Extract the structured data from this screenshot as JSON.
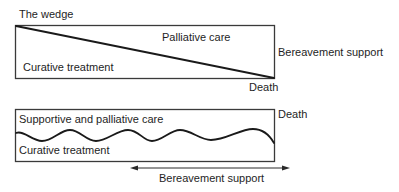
{
  "wedge_panel": {
    "title": "The wedge",
    "upper_region_label": "Palliative care",
    "lower_region_label": "Curative treatment",
    "end_label": "Death",
    "side_label": "Bereavement support"
  },
  "wave_panel": {
    "upper_region_label": "Supportive and palliative care",
    "lower_region_label": "Curative treatment",
    "end_label": "Death",
    "arrow_label": "Bereavement support",
    "arrow_direction": "bidirectional"
  },
  "colors": {
    "line": "#1a1a1a",
    "box_border": "#3a3a3a",
    "text": "#1e1e1e",
    "background": "#ffffff"
  }
}
